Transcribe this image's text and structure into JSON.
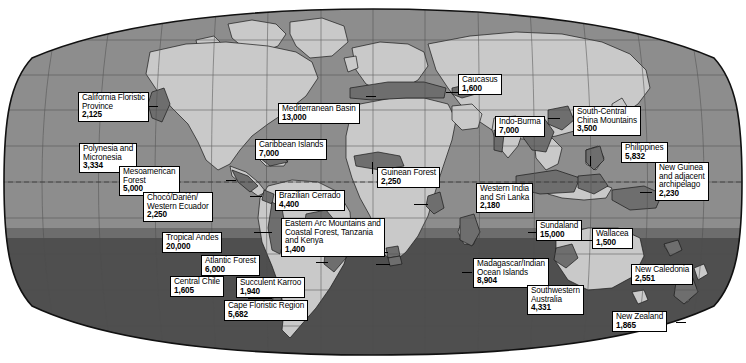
{
  "map": {
    "title": "Biodiversity Hotspots World Map",
    "projection": "robinson",
    "value_unit": "endemic plant species",
    "colors": {
      "ocean": "#8e8e8e",
      "ocean_south": "#4a4a4a",
      "land": "#c9c9c9",
      "hotspot": "#6f6f6f",
      "outline": "#1a1a1a",
      "graticule": "#5a5a5a",
      "label_bg": "#ffffff",
      "label_border": "#000000",
      "background": "#ffffff"
    }
  },
  "hotspots": [
    {
      "id": "california-floristic-province",
      "name": "California Floristic",
      "name2": "Province",
      "value": "2,125"
    },
    {
      "id": "polynesia-and-micronesia",
      "name": "Polynesia and",
      "name2": "Micronesia",
      "value": "3,334"
    },
    {
      "id": "mesoamerican-forest",
      "name": "Mesoamerican",
      "name2": "Forest",
      "value": "5,000"
    },
    {
      "id": "choco-darien-western-ecuador",
      "name": "Chocó/Darién/",
      "name2": "Western Ecuador",
      "value": "2,250"
    },
    {
      "id": "tropical-andes",
      "name": "Tropical Andes",
      "name2": "",
      "value": "20,000"
    },
    {
      "id": "central-chile",
      "name": "Central Chile",
      "name2": "",
      "value": "1,605"
    },
    {
      "id": "caribbean-islands",
      "name": "Caribbean Islands",
      "name2": "",
      "value": "7,000"
    },
    {
      "id": "brazilian-cerrado",
      "name": "Brazilian Cerrado",
      "name2": "",
      "value": "4,400"
    },
    {
      "id": "atlantic-forest",
      "name": "Atlantic Forest",
      "name2": "",
      "value": "6,000"
    },
    {
      "id": "mediterranean-basin",
      "name": "Mediterranean Basin",
      "name2": "",
      "value": "13,000"
    },
    {
      "id": "guinean-forest",
      "name": "Guinean Forest",
      "name2": "",
      "value": "2,250"
    },
    {
      "id": "eastern-arc-mountains",
      "name": "Eastern Arc Mountains and",
      "name2": "Coastal Forest, Tanzania",
      "name3": "and Kenya",
      "value": "1,400"
    },
    {
      "id": "succulent-karroo",
      "name": "Succulent Karroo",
      "name2": "",
      "value": "1,940"
    },
    {
      "id": "cape-floristic-region",
      "name": "Cape Floristic Region",
      "name2": "",
      "value": "5,682"
    },
    {
      "id": "caucasus",
      "name": "Caucasus",
      "name2": "",
      "value": "1,600"
    },
    {
      "id": "indo-burma",
      "name": "Indo-Burma",
      "name2": "",
      "value": "7,000"
    },
    {
      "id": "south-central-china-mountains",
      "name": "South-Central",
      "name2": "China Mountains",
      "value": "3,500"
    },
    {
      "id": "western-india-and-sri-lanka",
      "name": "Western India",
      "name2": "and Sri Lanka",
      "value": "2,180"
    },
    {
      "id": "philippines",
      "name": "Philippines",
      "name2": "",
      "value": "5,832"
    },
    {
      "id": "new-guinea-and-adjacent-archipelago",
      "name": "New Guinea",
      "name2": "and adjacent",
      "name3": "archipelago",
      "value": "2,230"
    },
    {
      "id": "sundaland",
      "name": "Sundaland",
      "name2": "",
      "value": "15,000"
    },
    {
      "id": "wallacea",
      "name": "Wallacea",
      "name2": "",
      "value": "1,500"
    },
    {
      "id": "madagascar-indian-ocean-islands",
      "name": "Madagascar/Indian",
      "name2": "Ocean Islands",
      "value": "8,904"
    },
    {
      "id": "southwestern-australia",
      "name": "Southwestern",
      "name2": "Australia",
      "value": "4,331"
    },
    {
      "id": "new-caledonia",
      "name": "New Caledonia",
      "name2": "",
      "value": "2,551"
    },
    {
      "id": "new-zealand",
      "name": "New Zealand",
      "name2": "",
      "value": "1,865"
    }
  ]
}
